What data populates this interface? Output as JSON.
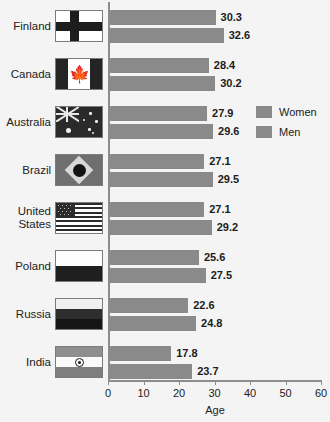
{
  "chart_data": {
    "type": "bar",
    "orientation": "horizontal",
    "title": "",
    "xlabel": "Age",
    "ylabel": "",
    "xlim": [
      0,
      60
    ],
    "xticks": [
      0,
      10,
      20,
      30,
      40,
      50,
      60
    ],
    "grid": false,
    "legend_position": "upper-right",
    "categories": [
      "Finland",
      "Canada",
      "Australia",
      "Brazil",
      "United States",
      "Poland",
      "Russia",
      "India"
    ],
    "series": [
      {
        "name": "Women",
        "values": [
          30.3,
          28.4,
          27.9,
          27.1,
          27.1,
          25.6,
          22.6,
          17.8
        ]
      },
      {
        "name": "Men",
        "values": [
          32.6,
          30.2,
          29.6,
          29.5,
          29.2,
          27.5,
          24.8,
          23.7
        ]
      }
    ],
    "bar_color": "#8a8a8a",
    "background_color": "#f4f4f4",
    "axis_color": "#8d8d8d"
  },
  "rows": [
    {
      "country": "Finland",
      "flag": "flag-finland",
      "women": "30.3",
      "men": "32.6"
    },
    {
      "country": "Canada",
      "flag": "flag-canada",
      "women": "28.4",
      "men": "30.2"
    },
    {
      "country": "Australia",
      "flag": "flag-australia",
      "women": "27.9",
      "men": "29.6"
    },
    {
      "country": "Brazil",
      "flag": "flag-brazil",
      "women": "27.1",
      "men": "29.5"
    },
    {
      "country": "United\nStates",
      "flag": "flag-united-states",
      "women": "27.1",
      "men": "29.2"
    },
    {
      "country": "Poland",
      "flag": "flag-poland",
      "women": "25.6",
      "men": "27.5"
    },
    {
      "country": "Russia",
      "flag": "flag-russia",
      "women": "22.6",
      "men": "24.8"
    },
    {
      "country": "India",
      "flag": "flag-india",
      "women": "17.8",
      "men": "23.7"
    }
  ],
  "axis": {
    "title": "Age",
    "ticks": [
      "0",
      "10",
      "20",
      "30",
      "40",
      "50",
      "60"
    ]
  },
  "legend": {
    "items": [
      {
        "label": "Women"
      },
      {
        "label": "Men"
      }
    ]
  }
}
